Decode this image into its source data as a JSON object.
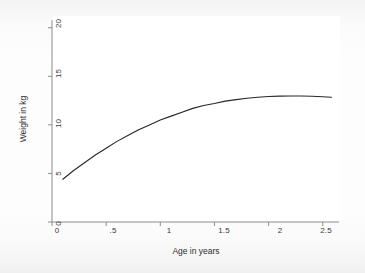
{
  "chart_data": {
    "type": "line",
    "title": "",
    "subtitle": "",
    "xlabel": "Age in years",
    "ylabel": "Weight in kg",
    "xlim": [
      0,
      2.65
    ],
    "ylim": [
      0,
      20.8
    ],
    "xticks": [
      "0",
      ".5",
      "1",
      "1.5",
      "2",
      "2.5"
    ],
    "xtick_values": [
      0,
      0.5,
      1,
      1.5,
      2,
      2.5
    ],
    "yticks": [
      "0",
      "5",
      "10",
      "15",
      "20"
    ],
    "ytick_values": [
      0,
      5,
      10,
      15,
      20
    ],
    "grid": false,
    "legend": null,
    "legend_position": "none",
    "line_color": "#262626",
    "background_color": "#ffffff",
    "series": [
      {
        "name": "Predicted weight",
        "x": [
          0.1,
          0.2,
          0.3,
          0.4,
          0.5,
          0.6,
          0.7,
          0.8,
          0.9,
          1.0,
          1.1,
          1.2,
          1.3,
          1.4,
          1.5,
          1.6,
          1.7,
          1.8,
          1.9,
          2.0,
          2.1,
          2.2,
          2.3,
          2.4,
          2.5,
          2.58
        ],
        "y": [
          4.4,
          5.3,
          6.1,
          6.9,
          7.6,
          8.3,
          8.9,
          9.5,
          10.0,
          10.5,
          10.9,
          11.3,
          11.7,
          12.0,
          12.2,
          12.45,
          12.6,
          12.75,
          12.85,
          12.92,
          12.96,
          12.98,
          12.98,
          12.95,
          12.9,
          12.85
        ]
      }
    ]
  },
  "axes": {
    "x_title": "Age in years",
    "y_title": "Weight in kg"
  }
}
